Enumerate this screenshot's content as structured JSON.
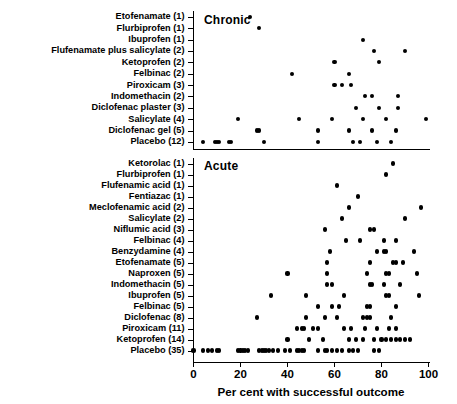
{
  "chart_data": {
    "type": "scatter",
    "title": "",
    "xlabel": "Per cent  with successful outcome",
    "ylabel": "",
    "xlim": [
      0,
      100
    ],
    "xticks": [
      0,
      20,
      40,
      60,
      80,
      100
    ],
    "xtick_labels": [
      "0",
      "20",
      "40",
      "60",
      "80",
      "100"
    ],
    "grid": false,
    "legend": "none",
    "panels": [
      {
        "name": "chronic-panel",
        "label": "Chronic",
        "categories": [
          "Etofenamate (1)",
          "Flurbiprofen (1)",
          "Ibuprofen (1)",
          "Flufenamate plus salicylate (2)",
          "Ketoprofen (2)",
          "Felbinac (2)",
          "Piroxicam (3)",
          "Indomethacin (2)",
          "Diclofenac plaster (3)",
          "Salicylate (4)",
          "Diclofenac gel (5)",
          "Placebo (12)"
        ],
        "series": [
          {
            "category": "Etofenamate (1)",
            "values": [
              24
            ]
          },
          {
            "category": "Flurbiprofen (1)",
            "values": [
              28
            ]
          },
          {
            "category": "Ibuprofen (1)",
            "values": [
              72
            ]
          },
          {
            "category": "Flufenamate plus salicylate (2)",
            "values": [
              77,
              90
            ]
          },
          {
            "category": "Ketoprofen (2)",
            "values": [
              60,
              79
            ]
          },
          {
            "category": "Felbinac (2)",
            "values": [
              42,
              66
            ]
          },
          {
            "category": "Piroxicam (3)",
            "values": [
              60,
              63,
              67
            ]
          },
          {
            "category": "Indomethacin (2)",
            "values": [
              73,
              76,
              87
            ]
          },
          {
            "category": "Diclofenac plaster (3)",
            "values": [
              69,
              79,
              87
            ]
          },
          {
            "category": "Salicylate (4)",
            "values": [
              19,
              45,
              59,
              72,
              82,
              99
            ]
          },
          {
            "category": "Diclofenac gel (5)",
            "values": [
              27,
              28,
              53,
              66,
              76,
              86
            ]
          },
          {
            "category": "Placebo (12)",
            "values": [
              4,
              9,
              10,
              11,
              15,
              16,
              30,
              53,
              68,
              71,
              78,
              84
            ]
          }
        ]
      },
      {
        "name": "acute-panel",
        "label": "Acute",
        "categories": [
          "Ketorolac (1)",
          "Flurbiprofen (1)",
          "Flufenamic acid (1)",
          "Fentiazac (1)",
          "Meclofenamic acid (2)",
          "Salicylate (2)",
          "Niflumic acid (3)",
          "Felbinac (4)",
          "Benzydamine (4)",
          "Etofenamate (5)",
          "Naproxen (5)",
          "Indomethacin (5)",
          "Ibuprofen (5)",
          "Felbinac (5)",
          "Diclofenac (8)",
          "Piroxicam (11)",
          "Ketoprofen (14)",
          "Placebo (35)"
        ],
        "series": [
          {
            "category": "Ketorolac (1)",
            "values": [
              85
            ]
          },
          {
            "category": "Flurbiprofen (1)",
            "values": [
              82
            ]
          },
          {
            "category": "Flufenamic acid (1)",
            "values": [
              61
            ]
          },
          {
            "category": "Fentiazac (1)",
            "values": [
              70
            ]
          },
          {
            "category": "Meclofenamic acid (2)",
            "values": [
              66,
              97
            ]
          },
          {
            "category": "Salicylate (2)",
            "values": [
              63,
              90
            ]
          },
          {
            "category": "Niflumic acid (3)",
            "values": [
              56,
              75,
              77
            ]
          },
          {
            "category": "Felbinac (4)",
            "values": [
              65,
              71,
              81,
              86
            ]
          },
          {
            "category": "Benzydamine (4)",
            "values": [
              58,
              78,
              81,
              82,
              94
            ]
          },
          {
            "category": "Etofenamate (5)",
            "values": [
              57,
              75,
              85,
              86,
              89
            ]
          },
          {
            "category": "Naproxen (5)",
            "values": [
              40,
              57,
              74,
              82,
              83,
              95
            ]
          },
          {
            "category": "Indomethacin (5)",
            "values": [
              57,
              59,
              75,
              76,
              81,
              88
            ]
          },
          {
            "category": "Ibuprofen (5)",
            "values": [
              33,
              48,
              64,
              82,
              83,
              96
            ]
          },
          {
            "category": "Felbinac (5)",
            "values": [
              53,
              59,
              62,
              74,
              75,
              86
            ]
          },
          {
            "category": "Diclofenac (8)",
            "values": [
              27,
              48,
              56,
              61,
              72,
              74,
              75,
              84
            ]
          },
          {
            "category": "Piroxicam (11)",
            "values": [
              44,
              46,
              47,
              51,
              53,
              64,
              67,
              73,
              78,
              83,
              86
            ]
          },
          {
            "category": "Ketoprofen (14)",
            "values": [
              40,
              49,
              55,
              66,
              69,
              72,
              77,
              80,
              82,
              84,
              86,
              88,
              90,
              92
            ]
          },
          {
            "category": "Placebo (35)",
            "values": [
              0,
              4,
              6,
              8,
              10,
              11,
              19,
              20,
              21,
              22,
              23,
              28,
              29,
              30,
              31,
              32,
              34,
              36,
              39,
              41,
              44,
              45,
              46,
              47,
              53,
              56,
              57,
              59,
              61,
              63,
              66,
              68,
              70,
              77,
              79
            ]
          }
        ]
      }
    ]
  }
}
